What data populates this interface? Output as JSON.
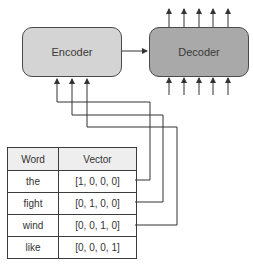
{
  "diagram": {
    "encoder": {
      "label": "Encoder",
      "fill": "#d4d4d4"
    },
    "decoder": {
      "label": "Decoder",
      "fill": "#a9a9a9"
    },
    "decoder_input_arrows": 5,
    "decoder_output_arrows": 5,
    "encoder_input_arrows": 3
  },
  "table": {
    "headers": [
      "Word",
      "Vector"
    ],
    "rows": [
      {
        "word": "the",
        "vector": "[1, 0, 0, 0]"
      },
      {
        "word": "fight",
        "vector": "[0, 1, 0, 0]"
      },
      {
        "word": "wind",
        "vector": "[0, 0, 1, 0]"
      },
      {
        "word": "like",
        "vector": "[0, 0, 0, 1]"
      }
    ]
  }
}
